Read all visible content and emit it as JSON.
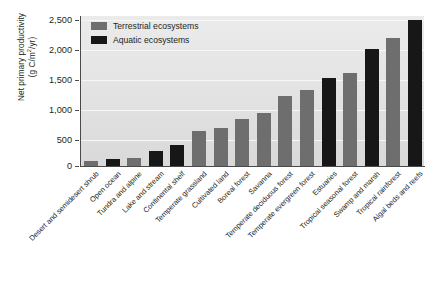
{
  "chart_data": {
    "type": "bar",
    "title": "",
    "xlabel": "",
    "ylabel": "Net primary productivity (g C/m2/yr)",
    "ylabel_line1": "Net primary productivity",
    "ylabel_line2_pre": "(g C/m",
    "ylabel_line2_sup": "2",
    "ylabel_line2_post": "/yr)",
    "ylim": [
      0,
      2500
    ],
    "ytick_labels": [
      "2,500",
      "2,000",
      "1,500",
      "1,000",
      "500",
      "0"
    ],
    "ytick_values": [
      2500,
      2000,
      1500,
      1000,
      500,
      0
    ],
    "grid": true,
    "legend_position": "top-left",
    "legend": [
      {
        "label": "Terrestrial ecosystems",
        "key": "terrestrial",
        "color": "#6e6e6e"
      },
      {
        "label": "Aquatic ecosystems",
        "key": "aquatic",
        "color": "#171717"
      }
    ],
    "categories": [
      "Desert and semidesert shrub",
      "Open ocean",
      "Tundra and alpine",
      "Lake and stream",
      "Continental shelf",
      "Temperate grassland",
      "Cultivated land",
      "Boreal forest",
      "Savanna",
      "Temperate deciduous forest",
      "Temperate evergreen forest",
      "Estuaries",
      "Tropical seasonal forest",
      "Swamp and marsh",
      "Tropical rainforest",
      "Algal beds and reefs"
    ],
    "values": [
      90,
      125,
      140,
      250,
      360,
      600,
      650,
      800,
      900,
      1200,
      1300,
      1500,
      1600,
      2000,
      2200,
      2500
    ],
    "series_type": [
      "terrestrial",
      "aquatic",
      "terrestrial",
      "aquatic",
      "aquatic",
      "terrestrial",
      "terrestrial",
      "terrestrial",
      "terrestrial",
      "terrestrial",
      "terrestrial",
      "aquatic",
      "terrestrial",
      "aquatic",
      "terrestrial",
      "aquatic"
    ]
  },
  "colors": {
    "terrestrial": "#6e6e6e",
    "aquatic": "#171717",
    "plot_background": "#e4e4e4",
    "gridline": "#f7f7f7",
    "axis": "#4a4a4a",
    "text": "#231f20"
  }
}
